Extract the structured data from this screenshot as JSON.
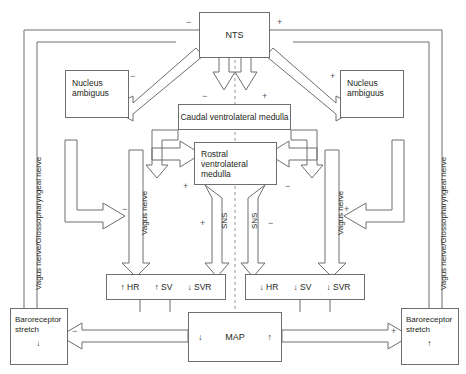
{
  "diagram": {
    "nodes": {
      "nts": "NTS",
      "nucleus_ambiguus_left": "Nucleus\nambiguus",
      "nucleus_ambiguus_right": "Nucleus\nambiguus",
      "cvlm": "Caudal ventrolateral medulla",
      "rvlm": "Rostral ventrolateral\nmedulla",
      "map": "MAP",
      "map_left_arrow": "↓",
      "map_right_arrow": "↑",
      "baroreceptor_left_line1": "Baroreceptor",
      "baroreceptor_left_line2": "stretch",
      "baroreceptor_left_arrow": "↓",
      "baroreceptor_right_line1": "Baroreceptor",
      "baroreceptor_right_line2": "stretch",
      "baroreceptor_right_arrow": "↑"
    },
    "effector_left": [
      "↑ HR",
      "↑ SV",
      "↓ SVR"
    ],
    "effector_right": [
      "↓ HR",
      "↓ SV",
      "↓ SVR"
    ],
    "pathway_labels": {
      "afferent_left": "Vagus nerve/Glossopharyngeal nerve",
      "afferent_right": "Vagus nerve/Glossopharyngeal nerve",
      "vagus_left": "Vagus nerve",
      "vagus_right": "Vagus nerve",
      "sns_left": "SNS",
      "sns_right": "SNS"
    },
    "signs": {
      "nts_left": "−",
      "nts_right": "+",
      "na_left": "−",
      "na_right": "+",
      "cvlm_left": "−",
      "cvlm_right": "+",
      "rvlm_left": "+",
      "rvlm_right": "−",
      "sns_left": "+",
      "sns_right": "−",
      "vagus_left": "−",
      "vagus_right": "+",
      "baro_left": "−",
      "baro_right": "+"
    },
    "colors": {
      "stroke": "#6d6e71",
      "text": "#231f20",
      "background": "#ffffff"
    }
  }
}
